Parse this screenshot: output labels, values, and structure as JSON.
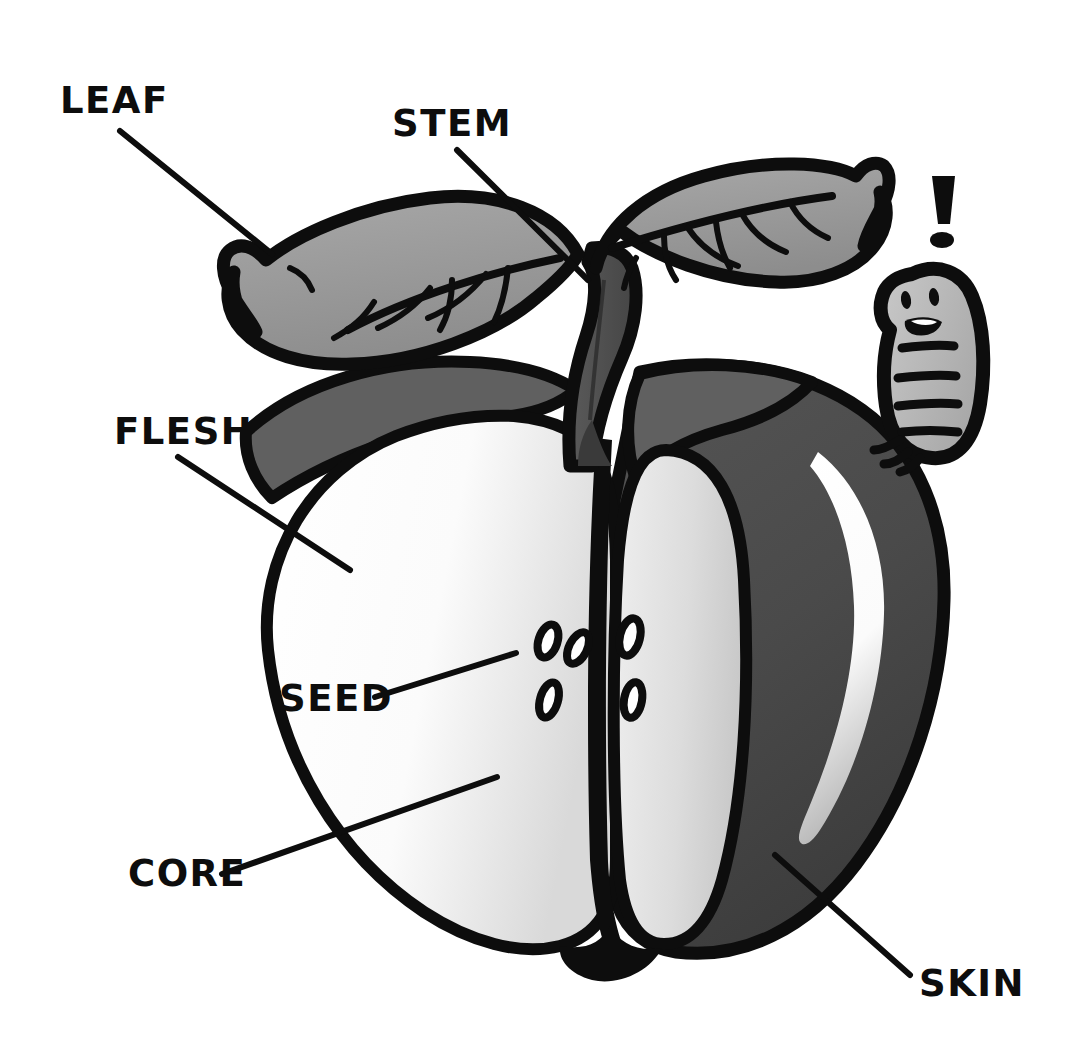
{
  "diagram": {
    "background_color": "#ffffff",
    "ink_color": "#0d0d0d",
    "style": "black-and-white cartoon clip-art with leader-line labels"
  },
  "labels": [
    {
      "id": "leaf",
      "text": "LEAF",
      "x": 60,
      "y": 113,
      "leader": {
        "x1": 120,
        "y1": 131,
        "x2": 272,
        "y2": 254
      }
    },
    {
      "id": "stem",
      "text": "STEM",
      "x": 392,
      "y": 136,
      "leader": {
        "x1": 457,
        "y1": 150,
        "x2": 588,
        "y2": 280
      }
    },
    {
      "id": "flesh",
      "text": "FLESH",
      "x": 114,
      "y": 444,
      "leader": {
        "x1": 178,
        "y1": 457,
        "x2": 350,
        "y2": 570
      }
    },
    {
      "id": "seed",
      "text": "SEED",
      "x": 279,
      "y": 711,
      "leader": {
        "x1": 375,
        "y1": 697,
        "x2": 516,
        "y2": 653
      }
    },
    {
      "id": "core",
      "text": "CORE",
      "x": 128,
      "y": 886,
      "leader": {
        "x1": 222,
        "y1": 874,
        "x2": 497,
        "y2": 777
      }
    },
    {
      "id": "skin",
      "text": "SKIN",
      "x": 919,
      "y": 996,
      "leader": {
        "x1": 910,
        "y1": 975,
        "x2": 775,
        "y2": 855
      }
    }
  ],
  "parts": {
    "leaf_left": {
      "name": "left leaf",
      "fill": "#9a9a9a",
      "outline": "#0d0d0d"
    },
    "leaf_right": {
      "name": "right leaf",
      "fill": "#9a9a9a",
      "outline": "#0d0d0d"
    },
    "stem": {
      "name": "stem",
      "fill": "#4e4e4e",
      "outline": "#0d0d0d"
    },
    "skin": {
      "name": "skin",
      "fill": "#4a4a4a",
      "outline": "#0d0d0d"
    },
    "skin_highlight": {
      "name": "skin highlight",
      "fill": "#ffffff"
    },
    "shoulder": {
      "name": "apple shoulder",
      "fill": "#585858"
    },
    "flesh_left": {
      "name": "left flesh lobe",
      "fill": "#f3f3f3"
    },
    "flesh_middle": {
      "name": "middle flesh lobe",
      "fill": "#d8d8d8"
    },
    "core": {
      "name": "core line",
      "fill": "#0d0d0d"
    },
    "seeds": {
      "name": "seeds",
      "count": 5,
      "fill": "#ffffff",
      "outline": "#0d0d0d"
    },
    "worm": {
      "name": "worm",
      "fill": "#b3b3b3",
      "outline": "#0d0d0d",
      "expression": "smiling"
    },
    "exclamation": {
      "name": "exclamation mark",
      "text": "!",
      "fill": "#0d0d0d"
    }
  },
  "worm": {
    "eye_count": 2,
    "mouth": "open smile",
    "segment_count": 5,
    "leg_count": 3
  }
}
